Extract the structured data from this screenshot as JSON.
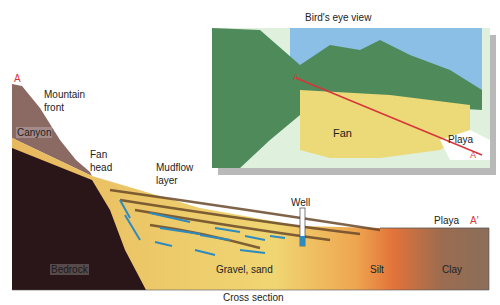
{
  "title_inset": "Bird's eye view",
  "title_section": "Cross section",
  "inset": {
    "labels": {
      "fan": "Fan",
      "playa": "Playa",
      "a": "A",
      "a_prime": "A'"
    },
    "colors": {
      "sky": "#8cbfe6",
      "mountains": "#4e8a5a",
      "fan": "#ecd978",
      "shadow": "#b9b9b9",
      "section_line": "#d8343a"
    }
  },
  "section": {
    "labels": {
      "a": "A",
      "a_prime": "A'",
      "mountain_front": "Mountain front",
      "mountain_front_l1": "Mountain",
      "mountain_front_l2": "front",
      "canyon": "Canyon",
      "fan_head_l1": "Fan",
      "fan_head_l2": "head",
      "mudflow_l1": "Mudflow",
      "mudflow_l2": "layer",
      "well": "Well",
      "playa": "Playa",
      "bedrock": "Bedrock",
      "gravel_sand": "Gravel, sand",
      "silt": "Silt",
      "clay": "Clay"
    },
    "colors": {
      "bedrock": "#2a1618",
      "mountain": "#8c6a64",
      "gravel": "#ecc56a",
      "silt": "#e5833e",
      "clay": "#8a6a56",
      "mudflow": "#6b4a2a",
      "water_arrows": "#2d8bc0"
    }
  }
}
